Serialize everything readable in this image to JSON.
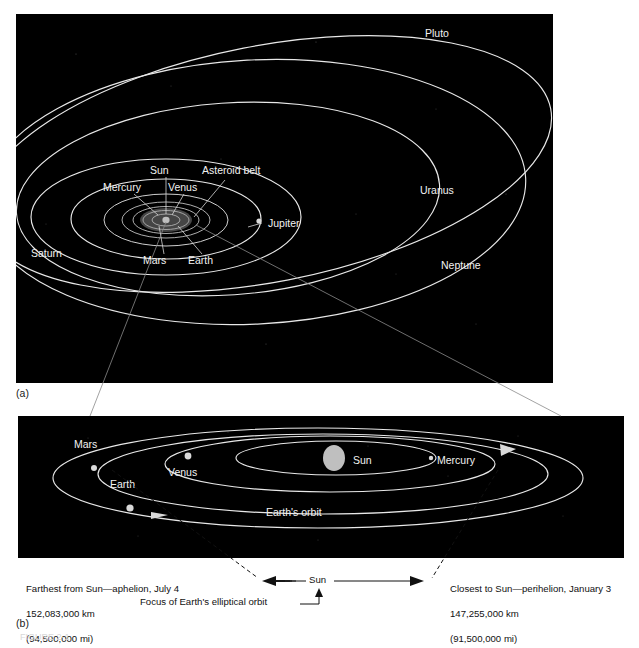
{
  "figure": {
    "panels": [
      {
        "id": "a",
        "letter": "(a)"
      },
      {
        "id": "b",
        "letter": "(b)"
      }
    ],
    "caption": "FIGURE 2-1"
  },
  "panel_a": {
    "title": "Solar system orbits",
    "labels": [
      {
        "name": "Pluto",
        "text": "Pluto"
      },
      {
        "name": "Uranus",
        "text": "Uranus"
      },
      {
        "name": "Neptune",
        "text": "Neptune"
      },
      {
        "name": "Saturn",
        "text": "Saturn"
      },
      {
        "name": "Jupiter",
        "text": "Jupiter"
      },
      {
        "name": "Sun",
        "text": "Sun"
      },
      {
        "name": "Mercury",
        "text": "Mercury"
      },
      {
        "name": "Venus",
        "text": "Venus"
      },
      {
        "name": "Asteroid belt",
        "text": "Asteroid belt"
      },
      {
        "name": "Mars",
        "text": "Mars"
      },
      {
        "name": "Earth",
        "text": "Earth"
      }
    ]
  },
  "panel_b": {
    "title": "Earth's elliptical orbit",
    "labels": [
      {
        "name": "Mars",
        "text": "Mars"
      },
      {
        "name": "Earth",
        "text": "Earth"
      },
      {
        "name": "Venus",
        "text": "Venus"
      },
      {
        "name": "Sun",
        "text": "Sun"
      },
      {
        "name": "Mercury",
        "text": "Mercury"
      },
      {
        "name": "Earth's orbit",
        "text": "Earth's orbit"
      }
    ]
  },
  "annotations": {
    "aphelion": {
      "line1": "Farthest from Sun—aphelion, July 4",
      "line2": "152,083,000 km",
      "line3": "(94,500,000 mi)"
    },
    "perihelion": {
      "line1": "Closest to Sun—perihelion, January 3",
      "line2": "147,255,000 km",
      "line3": "(91,500,000 mi)"
    },
    "sun_dimension": "Sun",
    "focus_note": "Focus of Earth's elliptical orbit"
  },
  "colors": {
    "space": "#000000",
    "orbit_line": "#e8e8e8",
    "label_text": "#f2f2f2",
    "page_text": "#111111",
    "sun": "#bfbfbf"
  }
}
